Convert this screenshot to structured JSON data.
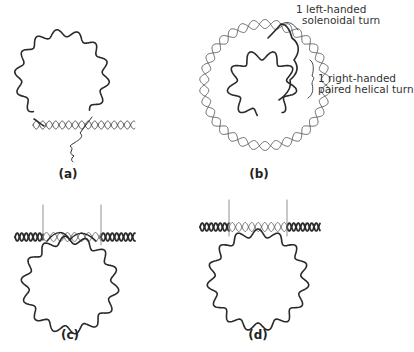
{
  "figure": {
    "panels": [
      {
        "id": "a",
        "label": "(a)"
      },
      {
        "id": "b",
        "label": "(b)"
      },
      {
        "id": "c",
        "label": "(c)"
      },
      {
        "id": "d",
        "label": "(d)"
      }
    ],
    "annotations": {
      "left_handed_line1": "1 left-handed",
      "left_handed_line2": "solenoidal turn",
      "right_handed_line1": "1 right-handed",
      "right_handed_line2": "paired helical turn"
    },
    "colors": {
      "stroke": "#2a2a2a",
      "light_stroke": "#777777",
      "background": "#ffffff"
    }
  }
}
